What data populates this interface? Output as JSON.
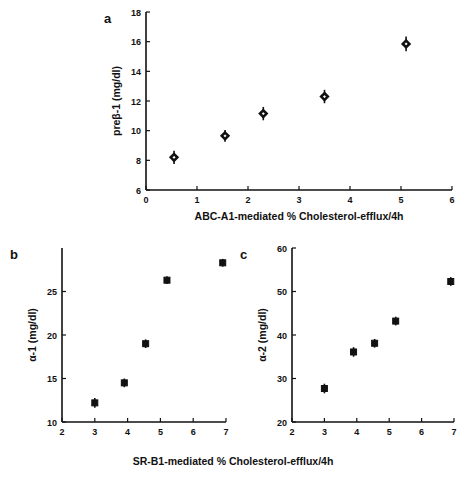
{
  "figure": {
    "shared_xlabel": "SR-B1-mediated % Cholesterol-efflux/4h",
    "background": "#ffffff",
    "marker_color": "#111111"
  },
  "chart_data": [
    {
      "type": "scatter",
      "panel_label": "a",
      "title": "",
      "xlabel": "ABC-A1-mediated % Cholesterol-efflux/4h",
      "ylabel": "preβ-1 (mg/dl)",
      "xlim": [
        0,
        6
      ],
      "ylim": [
        6,
        18
      ],
      "xticks": [
        0,
        1,
        2,
        3,
        4,
        5,
        6
      ],
      "xticklabels": [
        "0",
        "1",
        "2",
        "3",
        "4",
        "5",
        "6"
      ],
      "yticks": [
        6,
        8,
        10,
        12,
        14,
        16,
        18
      ],
      "yticklabels": [
        "6",
        "8",
        "10",
        "12",
        "14",
        "16",
        "18"
      ],
      "grid": false,
      "legend": "none",
      "marker": "open-diamond",
      "x": [
        0.55,
        1.55,
        2.3,
        3.5,
        5.1
      ],
      "y": [
        8.2,
        9.65,
        11.15,
        12.3,
        15.85
      ],
      "yerr": [
        0.45,
        0.4,
        0.45,
        0.45,
        0.5
      ]
    },
    {
      "type": "scatter",
      "panel_label": "b",
      "title": "",
      "xlabel": "SR-B1-mediated % Cholesterol-efflux/4h",
      "ylabel": "α-1 (mg/dl)",
      "xlim": [
        2,
        7
      ],
      "ylim": [
        10,
        30
      ],
      "xticks": [
        2,
        3,
        4,
        5,
        6,
        7
      ],
      "xticklabels": [
        "2",
        "3",
        "4",
        "5",
        "6",
        "7"
      ],
      "yticks": [
        10,
        15,
        20,
        25
      ],
      "yticklabels": [
        "10",
        "15",
        "20",
        "25"
      ],
      "grid": false,
      "legend": "none",
      "marker": "filled-square",
      "x": [
        3.0,
        3.9,
        4.55,
        5.2,
        6.9
      ],
      "y": [
        12.2,
        14.5,
        19.0,
        26.3,
        28.3
      ],
      "yerr": [
        0.55,
        0.5,
        0.5,
        0.45,
        0.45
      ]
    },
    {
      "type": "scatter",
      "panel_label": "c",
      "title": "",
      "xlabel": "SR-B1-mediated % Cholesterol-efflux/4h",
      "ylabel": "α-2 (mg/dl)",
      "xlim": [
        2,
        7
      ],
      "ylim": [
        20,
        60
      ],
      "xticks": [
        2,
        3,
        4,
        5,
        6,
        7
      ],
      "xticklabels": [
        "2",
        "3",
        "4",
        "5",
        "6",
        "7"
      ],
      "yticks": [
        20,
        30,
        40,
        50,
        60
      ],
      "yticklabels": [
        "20",
        "30",
        "40",
        "50",
        "60"
      ],
      "grid": false,
      "legend": "none",
      "marker": "filled-square",
      "x": [
        3.0,
        3.9,
        4.55,
        5.2,
        6.9
      ],
      "y": [
        27.7,
        36.1,
        38.1,
        43.2,
        52.3
      ],
      "yerr": [
        1.1,
        1.1,
        1.0,
        1.0,
        1.0
      ]
    }
  ]
}
